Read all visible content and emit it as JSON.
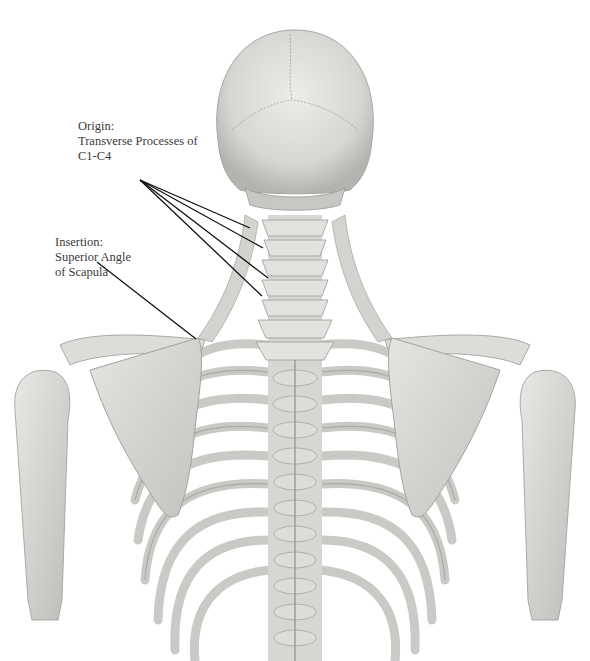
{
  "diagram": {
    "labels": {
      "origin": {
        "title": "Origin:",
        "line1": "Transverse Processes of",
        "line2": "C1-C4"
      },
      "insertion": {
        "title": "Insertion:",
        "line1": "Superior Angle",
        "line2": "of Scapula"
      }
    },
    "colors": {
      "background": "#ffffff",
      "bone_light": "#e6e6e4",
      "bone_mid": "#cfcfcc",
      "bone_shadow": "#9e9e9a",
      "leader_line": "#111111",
      "text": "#3a3a3a"
    }
  }
}
